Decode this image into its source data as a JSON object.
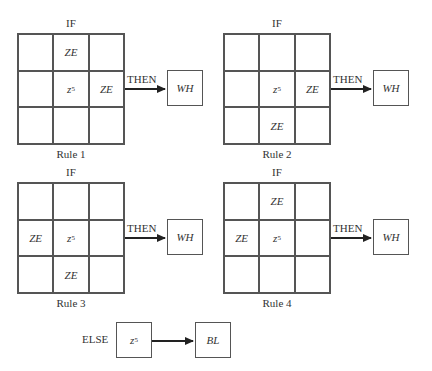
{
  "rules": [
    {
      "name": "Rule 1",
      "if_label": "IF",
      "then_label": "THEN",
      "output": "WH",
      "cells": [
        "",
        "ZE",
        "",
        "",
        "z5",
        "ZE",
        "",
        "",
        ""
      ]
    },
    {
      "name": "Rule 2",
      "if_label": "IF",
      "then_label": "THEN",
      "output": "WH",
      "cells": [
        "",
        "",
        "",
        "",
        "z5",
        "ZE",
        "",
        "ZE",
        ""
      ]
    },
    {
      "name": "Rule 3",
      "if_label": "IF",
      "then_label": "THEN",
      "output": "WH",
      "cells": [
        "",
        "",
        "",
        "ZE",
        "z5",
        "",
        "",
        "ZE",
        ""
      ]
    },
    {
      "name": "Rule 4",
      "if_label": "IF",
      "then_label": "THEN",
      "output": "WH",
      "cells": [
        "",
        "ZE",
        "",
        "ZE",
        "z5",
        "",
        "",
        "",
        ""
      ]
    }
  ],
  "else_rule": {
    "label": "ELSE",
    "input": "z5",
    "output": "BL"
  }
}
